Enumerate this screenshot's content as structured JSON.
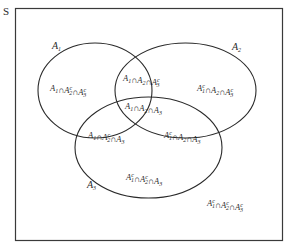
{
  "diagram": {
    "type": "venn",
    "universe_label": "S",
    "sets": [
      {
        "name": "A1",
        "base": "A",
        "sub": "1"
      },
      {
        "name": "A2",
        "base": "A",
        "sub": "2"
      },
      {
        "name": "A3",
        "base": "A",
        "sub": "3"
      }
    ],
    "regions": [
      {
        "id": "only_a1",
        "text": "A1 ∩ A2ᶜ ∩ A3ᶜ",
        "parts": [
          [
            "A",
            "1",
            ""
          ],
          [
            "A",
            "2",
            "c"
          ],
          [
            "A",
            "3",
            "c"
          ]
        ]
      },
      {
        "id": "a1_a2_not_a3",
        "text": "A1 ∩ A2 ∩ A3ᶜ",
        "parts": [
          [
            "A",
            "1",
            ""
          ],
          [
            "A",
            "2",
            ""
          ],
          [
            "A",
            "3",
            "c"
          ]
        ]
      },
      {
        "id": "only_a2",
        "text": "A1ᶜ ∩ A2 ∩ A3ᶜ",
        "parts": [
          [
            "A",
            "1",
            "c"
          ],
          [
            "A",
            "2",
            ""
          ],
          [
            "A",
            "3",
            "c"
          ]
        ]
      },
      {
        "id": "all_three",
        "text": "A1 ∩ A2 ∩ A3",
        "parts": [
          [
            "A",
            "1",
            ""
          ],
          [
            "A",
            "2",
            ""
          ],
          [
            "A",
            "3",
            ""
          ]
        ]
      },
      {
        "id": "a1_a3_not_a2",
        "text": "A1 ∩ A2ᶜ ∩ A3",
        "parts": [
          [
            "A",
            "1",
            ""
          ],
          [
            "A",
            "2",
            "c"
          ],
          [
            "A",
            "3",
            ""
          ]
        ]
      },
      {
        "id": "a2_a3_not_a1",
        "text": "A1ᶜ ∩ A2 ∩ A3",
        "parts": [
          [
            "A",
            "1",
            "c"
          ],
          [
            "A",
            "2",
            ""
          ],
          [
            "A",
            "3",
            ""
          ]
        ]
      },
      {
        "id": "only_a3",
        "text": "A1ᶜ ∩ A2ᶜ ∩ A3",
        "parts": [
          [
            "A",
            "1",
            "c"
          ],
          [
            "A",
            "2",
            "c"
          ],
          [
            "A",
            "3",
            ""
          ]
        ]
      },
      {
        "id": "none",
        "text": "A1ᶜ ∩ A2ᶜ ∩ A3ᶜ",
        "parts": [
          [
            "A",
            "1",
            "c"
          ],
          [
            "A",
            "2",
            "c"
          ],
          [
            "A",
            "3",
            "c"
          ]
        ]
      }
    ],
    "symbols": {
      "intersection": "∩",
      "complement": "c"
    },
    "colors": {
      "stroke": "#2a2a2a",
      "background": "#ffffff"
    }
  }
}
